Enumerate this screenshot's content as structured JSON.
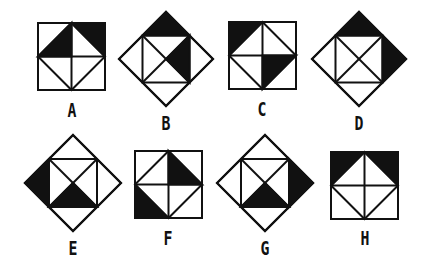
{
  "colors": {
    "ink": "#111111",
    "fill": "#111111",
    "paper": "#ffffff"
  },
  "figures": [
    {
      "label": "A",
      "kind": "square",
      "x": 38,
      "y": 23,
      "size": 67,
      "labelX": 62,
      "labelY": 100,
      "shaded": [
        "tl-inner",
        "tr-outer"
      ]
    },
    {
      "label": "B",
      "kind": "diamond",
      "cx": 166,
      "cy": 59,
      "r": 47,
      "labelX": 156,
      "labelY": 113,
      "shaded": [
        "top-cap",
        "right-inner"
      ]
    },
    {
      "label": "C",
      "kind": "square",
      "x": 229,
      "y": 22,
      "size": 67,
      "labelX": 252,
      "labelY": 99,
      "shaded": [
        "tl-outer",
        "br-inner"
      ]
    },
    {
      "label": "D",
      "kind": "diamond",
      "cx": 359,
      "cy": 59,
      "r": 47,
      "labelX": 349,
      "labelY": 113,
      "shaded": [
        "top-cap",
        "right-cap"
      ]
    },
    {
      "label": "E",
      "kind": "diamond",
      "cx": 73,
      "cy": 183,
      "r": 48,
      "labelX": 63,
      "labelY": 238,
      "shaded": [
        "left-cap",
        "bottom-inner"
      ]
    },
    {
      "label": "F",
      "kind": "square",
      "x": 135,
      "y": 151,
      "size": 67,
      "labelX": 158,
      "labelY": 228,
      "shaded": [
        "tr-inner",
        "bl-outer"
      ]
    },
    {
      "label": "G",
      "kind": "diamond",
      "cx": 265,
      "cy": 183,
      "r": 48,
      "labelX": 255,
      "labelY": 238,
      "shaded": [
        "right-cap",
        "bottom-inner"
      ]
    },
    {
      "label": "H",
      "kind": "square",
      "x": 331,
      "y": 152,
      "size": 67,
      "labelX": 355,
      "labelY": 228,
      "shaded": [
        "tl-outer",
        "tr-outer"
      ]
    }
  ]
}
